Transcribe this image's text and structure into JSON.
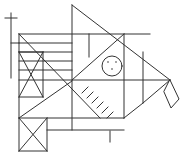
{
  "figure": {
    "stroke_color": "#333333",
    "background_color": "#ffffff",
    "eye": {
      "shape": "circle",
      "dots": 3
    },
    "hatch_marks": 6,
    "tail": "diamond",
    "crossed_boxes": 3,
    "stacked_stripes": 4
  },
  "watermark": {
    "text": ""
  }
}
